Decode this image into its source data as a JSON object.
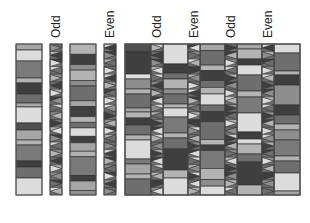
{
  "labels": {
    "odd_1": "Odd",
    "even_1": "Even",
    "odd_2": "Odd",
    "even_2": "Even",
    "odd_3": "Odd",
    "even_3": "Even"
  },
  "colors": {
    "dark": "#3f3f3f",
    "mid_dark": "#6a6a6a",
    "mid": "#8e8e8e",
    "light": "#b3b3b3",
    "very_light": "#dcdcdc",
    "outline": "#333333"
  },
  "layout": {
    "top": 44,
    "bottom": 195
  },
  "bars": [
    {
      "name": "bar-left-1",
      "x": 16,
      "w": 26,
      "stripes": [
        [
          "#a6a6a6",
          6
        ],
        [
          "#dcdcdc",
          11
        ],
        [
          "#7a7a7a",
          17
        ],
        [
          "#b3b3b3",
          5
        ],
        [
          "#3f3f3f",
          11
        ],
        [
          "#6e6e6e",
          9
        ],
        [
          "#a6a6a6",
          4
        ],
        [
          "#dcdcdc",
          16
        ],
        [
          "#4f4f4f",
          7
        ],
        [
          "#a6a6a6",
          10
        ],
        [
          "#b3b3b3",
          5
        ],
        [
          "#7a7a7a",
          16
        ],
        [
          "#3f3f3f",
          6
        ],
        [
          "#6e6e6e",
          11
        ],
        [
          "#dcdcdc",
          17
        ]
      ]
    },
    {
      "name": "bar-left-2",
      "x": 70,
      "w": 26,
      "stripes": [
        [
          "#b3b3b3",
          11
        ],
        [
          "#3f3f3f",
          11
        ],
        [
          "#8e8e8e",
          6
        ],
        [
          "#b3b3b3",
          11
        ],
        [
          "#8e8e8e",
          6
        ],
        [
          "#6e6e6e",
          16
        ],
        [
          "#a6a6a6",
          6
        ],
        [
          "#3f3f3f",
          11
        ],
        [
          "#b3b3b3",
          6
        ],
        [
          "#6e6e6e",
          6
        ],
        [
          "#dcdcdc",
          9
        ],
        [
          "#3f3f3f",
          7
        ],
        [
          "#a6a6a6",
          9
        ],
        [
          "#b3b3b3",
          6
        ],
        [
          "#7a7a7a",
          20
        ],
        [
          "#3f3f3f",
          6
        ],
        [
          "#a6a6a6",
          10
        ],
        [
          "#8e8e8e",
          5
        ]
      ]
    },
    {
      "name": "bar-right-1",
      "x": 125,
      "w": 26,
      "stripes": [
        [
          "#4f4f4f",
          8
        ],
        [
          "#3f3f3f",
          22
        ],
        [
          "#dcdcdc",
          5
        ],
        [
          "#8e8e8e",
          10
        ],
        [
          "#b3b3b3",
          5
        ],
        [
          "#6e6e6e",
          14
        ],
        [
          "#a6a6a6",
          4
        ],
        [
          "#b3b3b3",
          6
        ],
        [
          "#3f3f3f",
          7
        ],
        [
          "#6e6e6e",
          10
        ],
        [
          "#b3b3b3",
          5
        ],
        [
          "#dcdcdc",
          19
        ],
        [
          "#7a7a7a",
          5
        ],
        [
          "#a6a6a6",
          10
        ],
        [
          "#b3b3b3",
          5
        ],
        [
          "#6e6e6e",
          16
        ]
      ]
    },
    {
      "name": "bar-right-2",
      "x": 163,
      "w": 25,
      "stripes": [
        [
          "#dcdcdc",
          20
        ],
        [
          "#3f3f3f",
          9
        ],
        [
          "#6e6e6e",
          6
        ],
        [
          "#b3b3b3",
          10
        ],
        [
          "#8e8e8e",
          5
        ],
        [
          "#6e6e6e",
          10
        ],
        [
          "#b3b3b3",
          4
        ],
        [
          "#dcdcdc",
          9
        ],
        [
          "#7a7a7a",
          16
        ],
        [
          "#b3b3b3",
          5
        ],
        [
          "#6e6e6e",
          11
        ],
        [
          "#3f3f3f",
          21
        ],
        [
          "#b3b3b3",
          8
        ],
        [
          "#dcdcdc",
          17
        ]
      ]
    },
    {
      "name": "bar-right-3",
      "x": 200,
      "w": 25,
      "stripes": [
        [
          "#a6a6a6",
          6
        ],
        [
          "#6e6e6e",
          13
        ],
        [
          "#b3b3b3",
          5
        ],
        [
          "#3f3f3f",
          9
        ],
        [
          "#6e6e6e",
          6
        ],
        [
          "#b3b3b3",
          6
        ],
        [
          "#dcdcdc",
          10
        ],
        [
          "#6e6e6e",
          6
        ],
        [
          "#3f3f3f",
          9
        ],
        [
          "#6e6e6e",
          16
        ],
        [
          "#b3b3b3",
          5
        ],
        [
          "#3f3f3f",
          5
        ],
        [
          "#7a7a7a",
          16
        ],
        [
          "#b3b3b3",
          10
        ],
        [
          "#8e8e8e",
          6
        ],
        [
          "#dcdcdc",
          8
        ]
      ]
    },
    {
      "name": "bar-right-4",
      "x": 237,
      "w": 25,
      "stripes": [
        [
          "#a6a6a6",
          5
        ],
        [
          "#b3b3b3",
          10
        ],
        [
          "#3f3f3f",
          6
        ],
        [
          "#dcdcdc",
          10
        ],
        [
          "#6e6e6e",
          16
        ],
        [
          "#b3b3b3",
          6
        ],
        [
          "#7a7a7a",
          16
        ],
        [
          "#dcdcdc",
          19
        ],
        [
          "#3f3f3f",
          7
        ],
        [
          "#dcdcdc",
          5
        ],
        [
          "#b3b3b3",
          10
        ],
        [
          "#6e6e6e",
          8
        ],
        [
          "#3f3f3f",
          23
        ],
        [
          "#b3b3b3",
          10
        ]
      ]
    },
    {
      "name": "bar-right-5",
      "x": 274,
      "w": 26,
      "stripes": [
        [
          "#dcdcdc",
          9
        ],
        [
          "#6e6e6e",
          18
        ],
        [
          "#b3b3b3",
          4
        ],
        [
          "#3f3f3f",
          10
        ],
        [
          "#8e8e8e",
          20
        ],
        [
          "#3f3f3f",
          10
        ],
        [
          "#6e6e6e",
          9
        ],
        [
          "#b3b3b3",
          6
        ],
        [
          "#8e8e8e",
          10
        ],
        [
          "#7a7a7a",
          16
        ],
        [
          "#b3b3b3",
          5
        ],
        [
          "#6e6e6e",
          12
        ],
        [
          "#dcdcdc",
          18
        ],
        [
          "#a6a6a6",
          4
        ]
      ]
    }
  ],
  "strips": [
    {
      "name": "strip-odd-1",
      "x": 50,
      "w": 12,
      "label": "odd_1",
      "labelX": 48,
      "pattern": [
        "#8e8e8e",
        "#3f3f3f",
        "#dcdcdc",
        "#6e6e6e",
        "#b3b3b3",
        "#3f3f3f",
        "#dcdcdc",
        "#8e8e8e",
        "#6e6e6e",
        "#b3b3b3",
        "#3f3f3f",
        "#dcdcdc",
        "#8e8e8e",
        "#6e6e6e",
        "#b3b3b3",
        "#3f3f3f",
        "#dcdcdc",
        "#8e8e8e",
        "#6e6e6e",
        "#b3b3b3"
      ]
    },
    {
      "name": "strip-even-1",
      "x": 104,
      "w": 12,
      "label": "even_1",
      "labelX": 102,
      "pattern": [
        "#3f3f3f",
        "#8e8e8e",
        "#6e6e6e",
        "#dcdcdc",
        "#3f3f3f",
        "#b3b3b3",
        "#6e6e6e",
        "#dcdcdc",
        "#8e8e8e",
        "#3f3f3f",
        "#b3b3b3",
        "#dcdcdc",
        "#6e6e6e",
        "#8e8e8e",
        "#3f3f3f",
        "#b3b3b3",
        "#6e6e6e",
        "#dcdcdc",
        "#3f3f3f",
        "#8e8e8e"
      ]
    },
    {
      "name": "strip-odd-2",
      "x": 151,
      "w": 12,
      "label": "odd_2",
      "labelX": 148,
      "pattern": [
        "#b3b3b3",
        "#3f3f3f",
        "#8e8e8e",
        "#dcdcdc",
        "#6e6e6e",
        "#3f3f3f",
        "#b3b3b3",
        "#dcdcdc",
        "#8e8e8e",
        "#6e6e6e",
        "#3f3f3f",
        "#dcdcdc",
        "#b3b3b3",
        "#8e8e8e",
        "#3f3f3f",
        "#dcdcdc",
        "#6e6e6e",
        "#b3b3b3",
        "#3f3f3f",
        "#dcdcdc"
      ]
    },
    {
      "name": "strip-even-2",
      "x": 188,
      "w": 12,
      "label": "even_2",
      "labelX": 186,
      "pattern": [
        "#dcdcdc",
        "#6e6e6e",
        "#b3b3b3",
        "#3f3f3f",
        "#8e8e8e",
        "#dcdcdc",
        "#3f3f3f",
        "#b3b3b3",
        "#6e6e6e",
        "#dcdcdc",
        "#3f3f3f",
        "#8e8e8e",
        "#b3b3b3",
        "#3f3f3f",
        "#dcdcdc",
        "#6e6e6e",
        "#8e8e8e",
        "#3f3f3f",
        "#dcdcdc",
        "#b3b3b3"
      ]
    },
    {
      "name": "strip-odd-3",
      "x": 225,
      "w": 12,
      "label": "odd_3",
      "labelX": 223,
      "pattern": [
        "#3f3f3f",
        "#b3b3b3",
        "#dcdcdc",
        "#6e6e6e",
        "#3f3f3f",
        "#8e8e8e",
        "#dcdcdc",
        "#b3b3b3",
        "#3f3f3f",
        "#6e6e6e",
        "#dcdcdc",
        "#8e8e8e",
        "#3f3f3f",
        "#b3b3b3",
        "#6e6e6e",
        "#dcdcdc",
        "#3f3f3f",
        "#8e8e8e",
        "#b3b3b3",
        "#6e6e6e"
      ]
    },
    {
      "name": "strip-even-3",
      "x": 262,
      "w": 12,
      "label": "even_3",
      "labelX": 260,
      "pattern": [
        "#3f3f3f",
        "#8e8e8e",
        "#6e6e6e",
        "#dcdcdc",
        "#b3b3b3",
        "#3f3f3f",
        "#8e8e8e",
        "#dcdcdc",
        "#6e6e6e",
        "#3f3f3f",
        "#b3b3b3",
        "#dcdcdc",
        "#8e8e8e",
        "#3f3f3f",
        "#6e6e6e",
        "#dcdcdc",
        "#b3b3b3",
        "#3f3f3f",
        "#8e8e8e",
        "#6e6e6e"
      ]
    }
  ]
}
